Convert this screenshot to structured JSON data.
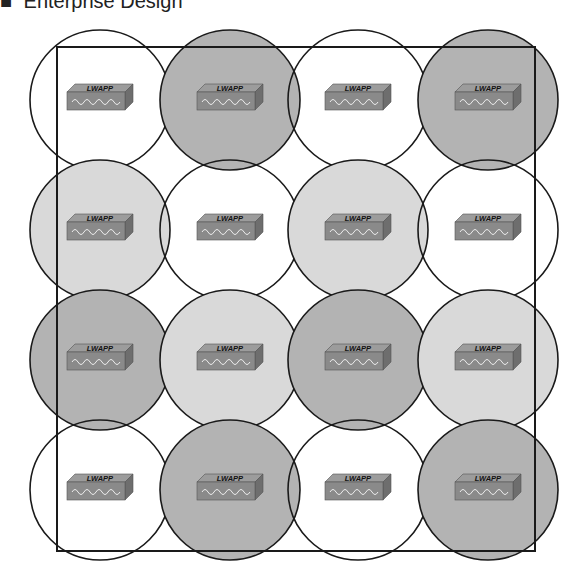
{
  "header": {
    "bullet": "■",
    "title": "Enterprise Design"
  },
  "colors": {
    "white": "#ffffff",
    "light": "#d9d9d9",
    "dark": "#b3b3b3",
    "stroke": "#1a1a1a",
    "ap_front": "#8a8a8a",
    "ap_top": "#9c9c9c",
    "ap_side": "#6e6e6e"
  },
  "ap_label": "LWAPP",
  "grid": {
    "cols_x": [
      100,
      230,
      358,
      488
    ],
    "rows_y": [
      100,
      230,
      360,
      490
    ],
    "radius": 70,
    "rows": [
      [
        "white",
        "dark",
        "white",
        "dark"
      ],
      [
        "light",
        "white",
        "light",
        "white"
      ],
      [
        "dark",
        "light",
        "dark",
        "light"
      ],
      [
        "white",
        "dark",
        "white",
        "dark"
      ]
    ]
  },
  "boundary": {
    "x": 57,
    "y": 47,
    "width": 478,
    "height": 504
  }
}
